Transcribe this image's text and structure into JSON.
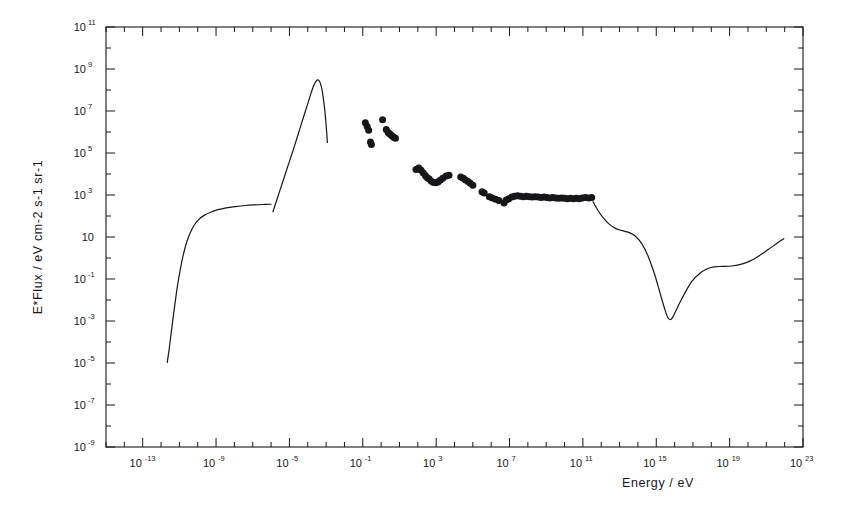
{
  "figure": {
    "background_color": "#ffffff",
    "ink_color": "#17171a",
    "frame": {
      "left": 106,
      "top": 27,
      "right": 803,
      "bottom": 447
    }
  },
  "chart_data": {
    "type": "line",
    "title": "",
    "subtitle": "",
    "xlabel": "Energy / eV",
    "ylabel": "E*Flux / eV cm-2 s-1 sr-1",
    "xscale": "log",
    "yscale": "log",
    "xlim": [
      1e-15,
      1e+23
    ],
    "ylim": [
      1e-09,
      100000000000.0
    ],
    "xlim_log": [
      -15,
      23
    ],
    "ylim_log": [
      -9,
      11
    ],
    "grid": false,
    "legend": null,
    "annotations": [],
    "xticks_major_log": [
      -13,
      -9,
      -5,
      -1,
      3,
      7,
      11,
      15,
      19,
      23
    ],
    "xtick_labels": [
      {
        "base": "10",
        "exp": "-13"
      },
      {
        "base": "10",
        "exp": "-9"
      },
      {
        "base": "10",
        "exp": "-5"
      },
      {
        "base": "10",
        "exp": "-1"
      },
      {
        "base": "10",
        "exp": "3"
      },
      {
        "base": "10",
        "exp": "7"
      },
      {
        "base": "10",
        "exp": "11"
      },
      {
        "base": "10",
        "exp": "15"
      },
      {
        "base": "10",
        "exp": "19"
      },
      {
        "base": "10",
        "exp": "23"
      }
    ],
    "yticks_major_log": [
      -9,
      -7,
      -5,
      -3,
      -1,
      1,
      3,
      5,
      7,
      9,
      11
    ],
    "ytick_labels": [
      {
        "base": "10",
        "exp": "-9"
      },
      {
        "base": "10",
        "exp": "-7"
      },
      {
        "base": "10",
        "exp": "-5"
      },
      {
        "base": "10",
        "exp": "-3"
      },
      {
        "base": "10",
        "exp": "-1"
      },
      {
        "base": "10",
        "exp": ""
      },
      {
        "base": "10",
        "exp": "3"
      },
      {
        "base": "10",
        "exp": "5"
      },
      {
        "base": "10",
        "exp": "7"
      },
      {
        "base": "10",
        "exp": "9"
      },
      {
        "base": "10",
        "exp": "11"
      }
    ],
    "series": [
      {
        "name": "radio-background-curve",
        "style": "line",
        "color": "#17171a",
        "points_log": [
          [
            -11.66,
            -4.97
          ],
          [
            -11.55,
            -4.3
          ],
          [
            -11.45,
            -3.6
          ],
          [
            -11.35,
            -2.9
          ],
          [
            -11.22,
            -2.05
          ],
          [
            -11.1,
            -1.3
          ],
          [
            -10.95,
            -0.55
          ],
          [
            -10.8,
            0.1
          ],
          [
            -10.62,
            0.7
          ],
          [
            -10.42,
            1.18
          ],
          [
            -10.2,
            1.55
          ],
          [
            -9.95,
            1.83
          ],
          [
            -9.65,
            2.03
          ],
          [
            -9.3,
            2.18
          ],
          [
            -8.9,
            2.3
          ],
          [
            -8.45,
            2.39
          ],
          [
            -7.95,
            2.45
          ],
          [
            -7.4,
            2.5
          ],
          [
            -6.85,
            2.53
          ],
          [
            -6.35,
            2.55
          ],
          [
            -6.0,
            2.56
          ]
        ]
      },
      {
        "name": "cmb-blackbody-curve",
        "style": "line",
        "color": "#17171a",
        "points_log": [
          [
            -5.9,
            2.2
          ],
          [
            -5.6,
            3.0
          ],
          [
            -5.3,
            3.8
          ],
          [
            -5.0,
            4.6
          ],
          [
            -4.7,
            5.4
          ],
          [
            -4.45,
            6.1
          ],
          [
            -4.2,
            6.8
          ],
          [
            -4.0,
            7.35
          ],
          [
            -3.82,
            7.85
          ],
          [
            -3.68,
            8.2
          ],
          [
            -3.56,
            8.4
          ],
          [
            -3.46,
            8.48
          ],
          [
            -3.38,
            8.44
          ],
          [
            -3.3,
            8.28
          ],
          [
            -3.22,
            8.0
          ],
          [
            -3.15,
            7.6
          ],
          [
            -3.08,
            7.1
          ],
          [
            -3.02,
            6.55
          ],
          [
            -2.97,
            6.0
          ],
          [
            -2.93,
            5.5
          ]
        ]
      },
      {
        "name": "xray-gamma-background-curve",
        "style": "line",
        "color": "#17171a",
        "points_log": [
          [
            11.55,
            2.68
          ],
          [
            11.8,
            2.3
          ],
          [
            12.1,
            1.92
          ],
          [
            12.45,
            1.6
          ],
          [
            12.8,
            1.4
          ],
          [
            13.15,
            1.3
          ],
          [
            13.5,
            1.22
          ],
          [
            13.85,
            1.05
          ],
          [
            14.2,
            0.7
          ],
          [
            14.55,
            0.1
          ],
          [
            14.9,
            -0.75
          ],
          [
            15.2,
            -1.65
          ],
          [
            15.45,
            -2.4
          ],
          [
            15.62,
            -2.82
          ],
          [
            15.75,
            -2.93
          ],
          [
            15.88,
            -2.85
          ],
          [
            16.05,
            -2.55
          ],
          [
            16.3,
            -2.1
          ],
          [
            16.6,
            -1.6
          ],
          [
            16.95,
            -1.1
          ],
          [
            17.35,
            -0.75
          ],
          [
            17.75,
            -0.52
          ],
          [
            18.15,
            -0.42
          ],
          [
            18.6,
            -0.4
          ],
          [
            19.1,
            -0.38
          ],
          [
            19.6,
            -0.3
          ],
          [
            20.1,
            -0.15
          ],
          [
            20.6,
            0.1
          ],
          [
            21.1,
            0.4
          ],
          [
            21.55,
            0.68
          ],
          [
            21.95,
            0.92
          ]
        ]
      }
    ],
    "scatter": {
      "name": "measured-background-points",
      "marker": "filled-circle",
      "color": "#17171a",
      "size_px": 7,
      "points_log": [
        [
          -0.86,
          6.44
        ],
        [
          -0.76,
          6.26
        ],
        [
          -0.68,
          6.08
        ],
        [
          -0.58,
          5.52
        ],
        [
          -0.53,
          5.4
        ],
        [
          0.08,
          6.58
        ],
        [
          0.28,
          6.12
        ],
        [
          0.38,
          5.98
        ],
        [
          0.46,
          5.92
        ],
        [
          0.54,
          5.86
        ],
        [
          0.62,
          5.8
        ],
        [
          0.7,
          5.74
        ],
        [
          0.78,
          5.7
        ],
        [
          1.9,
          4.22
        ],
        [
          2.05,
          4.28
        ],
        [
          2.18,
          4.18
        ],
        [
          2.3,
          4.05
        ],
        [
          2.42,
          3.92
        ],
        [
          2.52,
          3.82
        ],
        [
          2.62,
          3.76
        ],
        [
          2.74,
          3.66
        ],
        [
          2.86,
          3.6
        ],
        [
          2.98,
          3.58
        ],
        [
          3.1,
          3.62
        ],
        [
          3.22,
          3.7
        ],
        [
          3.36,
          3.8
        ],
        [
          3.54,
          3.9
        ],
        [
          3.7,
          3.94
        ],
        [
          4.34,
          3.86
        ],
        [
          4.48,
          3.8
        ],
        [
          4.6,
          3.72
        ],
        [
          4.74,
          3.64
        ],
        [
          4.86,
          3.56
        ],
        [
          5.0,
          3.46
        ],
        [
          5.5,
          3.16
        ],
        [
          5.62,
          3.1
        ],
        [
          5.9,
          2.92
        ],
        [
          6.06,
          2.86
        ],
        [
          6.24,
          2.8
        ],
        [
          6.42,
          2.74
        ],
        [
          6.7,
          2.62
        ],
        [
          6.82,
          2.76
        ],
        [
          6.96,
          2.82
        ],
        [
          7.12,
          2.9
        ],
        [
          7.28,
          2.94
        ],
        [
          7.44,
          2.96
        ],
        [
          7.6,
          2.94
        ],
        [
          7.76,
          2.92
        ],
        [
          7.92,
          2.94
        ],
        [
          8.08,
          2.92
        ],
        [
          8.24,
          2.9
        ],
        [
          8.4,
          2.92
        ],
        [
          8.56,
          2.9
        ],
        [
          8.72,
          2.88
        ],
        [
          8.88,
          2.9
        ],
        [
          9.04,
          2.88
        ],
        [
          9.2,
          2.86
        ],
        [
          9.36,
          2.88
        ],
        [
          9.52,
          2.86
        ],
        [
          9.68,
          2.84
        ],
        [
          9.84,
          2.86
        ],
        [
          10.0,
          2.84
        ],
        [
          10.16,
          2.82
        ],
        [
          10.32,
          2.84
        ],
        [
          10.48,
          2.82
        ],
        [
          10.64,
          2.84
        ],
        [
          10.8,
          2.82
        ],
        [
          10.96,
          2.86
        ],
        [
          11.14,
          2.88
        ],
        [
          11.32,
          2.86
        ],
        [
          11.48,
          2.88
        ]
      ]
    }
  }
}
